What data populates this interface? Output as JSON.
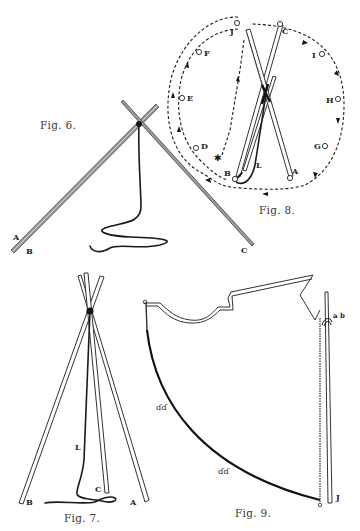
{
  "plate": {
    "figures": [
      {
        "id": "fig6",
        "caption": "Fig. 6.",
        "labels": {
          "a": "A",
          "b": "B",
          "c": "C"
        },
        "description": "Two poles crossed and tied at the top with a trailing cord"
      },
      {
        "id": "fig7",
        "caption": "Fig. 7.",
        "labels": {
          "a": "A",
          "b": "B",
          "c": "C",
          "l": "L"
        },
        "description": "Three poles tied into a tripod with lashing cord L"
      },
      {
        "id": "fig8",
        "caption": "Fig. 8.",
        "labels": {
          "a": "A",
          "b": "B",
          "c": "C",
          "d": "D",
          "e": "E",
          "f": "F",
          "g": "G",
          "h": "H",
          "i": "I",
          "j": "J",
          "l": "L"
        },
        "pegs": [
          "A",
          "B",
          "C",
          "D",
          "E",
          "F",
          "G",
          "H",
          "I",
          "J"
        ],
        "description": "Plan view of pole positions on a circle with dashed path showing cover placement"
      },
      {
        "id": "fig9",
        "caption": "Fig. 9.",
        "labels": {
          "j": "J",
          "ab": "a b"
        },
        "description": "Tipi cover (half) shown tied to lifting pole J"
      }
    ]
  }
}
